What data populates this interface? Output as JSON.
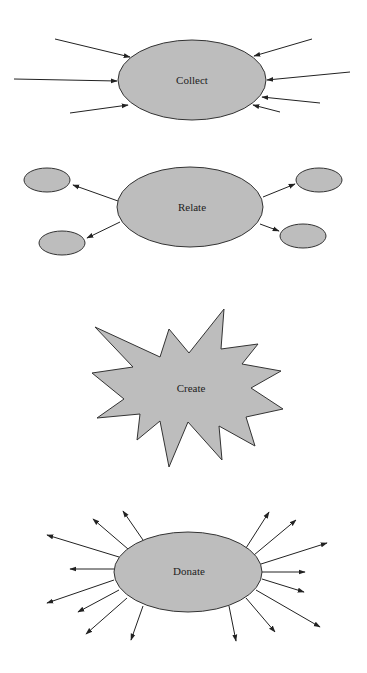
{
  "diagram": {
    "type": "concept-stages",
    "stages": [
      {
        "id": "collect",
        "label": "Collect",
        "shape": "ellipse",
        "arrow_direction": "inward",
        "arrow_count": 7
      },
      {
        "id": "relate",
        "label": "Relate",
        "shape": "ellipse",
        "arrow_direction": "outward-to-nodes",
        "connected_nodes": 4
      },
      {
        "id": "create",
        "label": "Create",
        "shape": "starburst"
      },
      {
        "id": "donate",
        "label": "Donate",
        "shape": "ellipse",
        "arrow_direction": "outward",
        "arrow_count": 16
      }
    ],
    "colors": {
      "fill": "#bdbdbd",
      "stroke": "#333333",
      "background": "#ffffff"
    }
  }
}
